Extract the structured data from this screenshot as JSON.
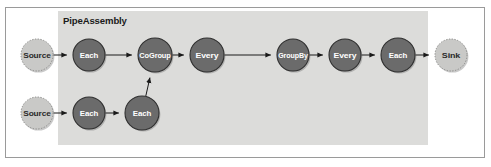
{
  "figure": {
    "width": 491,
    "height": 167,
    "background_color": "#ffffff",
    "frame_border_color": "#9a9a9a"
  },
  "group_box": {
    "title": "PipeAssembly",
    "fill_color": "#dcdcda",
    "x": 58,
    "y": 11,
    "width": 370,
    "height": 134,
    "title_x": 63,
    "title_y": 24
  },
  "node_styles": {
    "dark": {
      "fill_color": "#6b6b6b",
      "stroke_color": "#2f2f2f",
      "text_color": "#ffffff",
      "border_style": "solid"
    },
    "light": {
      "fill_color": "#c9c9c7",
      "stroke_color": "#8a8a88",
      "text_color": "#2a2a2a",
      "border_style": "dotted"
    }
  },
  "nodes": [
    {
      "id": "source-top",
      "label": "Source",
      "style": "light",
      "cx": 37,
      "cy": 55,
      "r": 16
    },
    {
      "id": "each-top-1",
      "label": "Each",
      "style": "dark",
      "cx": 89,
      "cy": 55,
      "r": 16
    },
    {
      "id": "cogroup",
      "label": "CoGroup",
      "style": "dark",
      "cx": 155,
      "cy": 55,
      "r": 17
    },
    {
      "id": "every-1",
      "label": "Every",
      "style": "dark",
      "cx": 207,
      "cy": 55,
      "r": 17
    },
    {
      "id": "groupby",
      "label": "GroupBy",
      "style": "dark",
      "cx": 293,
      "cy": 55,
      "r": 16
    },
    {
      "id": "every-2",
      "label": "Every",
      "style": "dark",
      "cx": 345,
      "cy": 55,
      "r": 16
    },
    {
      "id": "each-top-2",
      "label": "Each",
      "style": "dark",
      "cx": 398,
      "cy": 55,
      "r": 17
    },
    {
      "id": "sink",
      "label": "Sink",
      "style": "light",
      "cx": 451,
      "cy": 55,
      "r": 16
    },
    {
      "id": "source-bot",
      "label": "Source",
      "style": "light",
      "cx": 37,
      "cy": 113,
      "r": 16
    },
    {
      "id": "each-bot-1",
      "label": "Each",
      "style": "dark",
      "cx": 89,
      "cy": 113,
      "r": 16
    },
    {
      "id": "each-bot-2",
      "label": "Each",
      "style": "dark",
      "cx": 142,
      "cy": 113,
      "r": 17
    }
  ],
  "edges": [
    {
      "id": "source-top-to-each-top-1",
      "from": "source-top",
      "to": "each-top-1"
    },
    {
      "id": "each-top-1-to-cogroup",
      "from": "each-top-1",
      "to": "cogroup"
    },
    {
      "id": "cogroup-to-every-1",
      "from": "cogroup",
      "to": "every-1"
    },
    {
      "id": "every-1-to-groupby",
      "from": "every-1",
      "to": "groupby"
    },
    {
      "id": "groupby-to-every-2",
      "from": "groupby",
      "to": "every-2"
    },
    {
      "id": "every-2-to-each-top-2",
      "from": "every-2",
      "to": "each-top-2"
    },
    {
      "id": "each-top-2-to-sink",
      "from": "each-top-2",
      "to": "sink"
    },
    {
      "id": "source-bot-to-each-bot-1",
      "from": "source-bot",
      "to": "each-bot-1"
    },
    {
      "id": "each-bot-1-to-each-bot-2",
      "from": "each-bot-1",
      "to": "each-bot-2"
    },
    {
      "id": "each-bot-2-to-cogroup",
      "from": "each-bot-2",
      "to": "cogroup"
    }
  ],
  "edge_style": {
    "line_color": "#1a1a1a",
    "line_width": 1,
    "arrow_color": "#1a1a1a"
  }
}
